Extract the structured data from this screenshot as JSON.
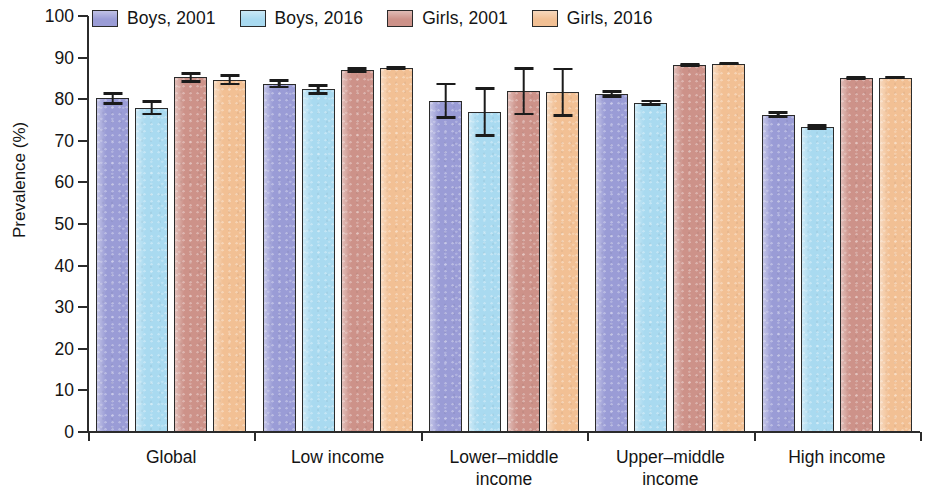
{
  "chart_data": {
    "type": "bar",
    "title": "",
    "subtitle": "",
    "xlabel": "",
    "ylabel": "Prevalence (%)",
    "ylim": [
      0,
      100
    ],
    "ytick_step": 10,
    "yticks": [
      0,
      10,
      20,
      30,
      40,
      50,
      60,
      70,
      80,
      90,
      100
    ],
    "grid": false,
    "legend_position": "top-left",
    "error_bars": "95% CI",
    "categories": [
      "Global",
      "Low income",
      "Lower–middle\nincome",
      "Upper–middle\nincome",
      "High income"
    ],
    "series": [
      {
        "name": "Boys, 2001",
        "color": "#9a9cd6",
        "values": [
          80.2,
          83.7,
          79.6,
          81.3,
          76.3
        ],
        "err_low": [
          1.6,
          1.1,
          4.4,
          0.9,
          0.8
        ],
        "err_high": [
          1.6,
          1.1,
          4.4,
          0.9,
          0.8
        ]
      },
      {
        "name": "Boys, 2016",
        "color": "#a9daf0",
        "values": [
          77.9,
          82.4,
          77.0,
          79.1,
          73.4
        ],
        "err_low": [
          1.8,
          1.3,
          6.0,
          0.8,
          0.7
        ],
        "err_high": [
          1.8,
          1.3,
          6.0,
          0.8,
          0.7
        ]
      },
      {
        "name": "Girls, 2001",
        "color": "#cd9289",
        "values": [
          85.3,
          87.1,
          81.9,
          88.3,
          85.1
        ],
        "err_low": [
          1.3,
          0.7,
          5.8,
          0.5,
          0.5
        ],
        "err_high": [
          1.3,
          0.7,
          5.8,
          0.5,
          0.5
        ]
      },
      {
        "name": "Girls, 2016",
        "color": "#f2c094",
        "values": [
          84.7,
          87.4,
          81.7,
          88.5,
          85.2
        ],
        "err_low": [
          1.4,
          0.5,
          5.9,
          0.4,
          0.4
        ],
        "err_high": [
          1.4,
          0.5,
          5.9,
          0.4,
          0.4
        ]
      }
    ]
  },
  "legend": {
    "items": [
      {
        "label": "Boys, 2001"
      },
      {
        "label": "Boys, 2016"
      },
      {
        "label": "Girls, 2001"
      },
      {
        "label": "Girls, 2016"
      }
    ]
  },
  "axes": {
    "y_label": "Prevalence (%)",
    "y_tick_labels": [
      "100",
      "90",
      "80",
      "70",
      "60",
      "50",
      "40",
      "30",
      "20",
      "10",
      "0"
    ],
    "x_tick_labels": [
      "Global",
      "Low income",
      "Lower–middle\nincome",
      "Upper–middle\nincome",
      "High income"
    ]
  }
}
